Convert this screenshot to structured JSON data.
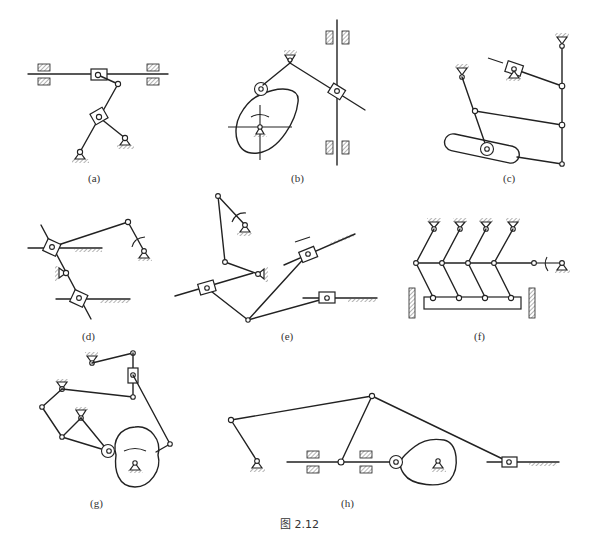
{
  "figure": {
    "caption": "图 2.12",
    "panels": [
      {
        "id": "a",
        "label": "(a)"
      },
      {
        "id": "b",
        "label": "(b)"
      },
      {
        "id": "c",
        "label": "(c)"
      },
      {
        "id": "d",
        "label": "(d)"
      },
      {
        "id": "e",
        "label": "(e)"
      },
      {
        "id": "f",
        "label": "(f)"
      },
      {
        "id": "g",
        "label": "(g)"
      },
      {
        "id": "h",
        "label": "(h)"
      }
    ]
  },
  "colors": {
    "line": "#222222",
    "background": "#ffffff",
    "text": "#333333"
  }
}
